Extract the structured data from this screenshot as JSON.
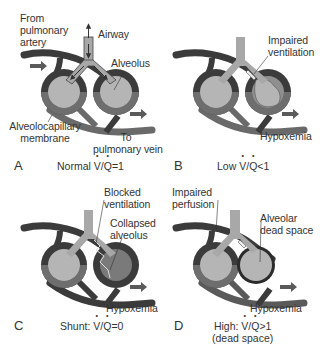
{
  "colors": {
    "vessel_dark": "#3b3b3b",
    "vessel_mid": "#6e6e6e",
    "airway_fill": "#a8a8a8",
    "alveolus_fill": "#b5b5b5",
    "collapsed_fill": "#8a8a8a",
    "arrow": "#5a5a5a",
    "background": "#ffffff"
  },
  "panels": [
    {
      "letter": "A",
      "caption_prefix": "Normal ",
      "caption_v": "V",
      "caption_slash": "/",
      "caption_q": "Q",
      "caption_suffix": "=1",
      "labels": {
        "from_artery": [
          "From",
          "pulmonary",
          "artery"
        ],
        "airway": "Airway",
        "alveolus": "Alveolus",
        "membrane": [
          "Alveolocapillary",
          "membrane"
        ],
        "to_vein": [
          "To",
          "pulmonary vein"
        ]
      }
    },
    {
      "letter": "B",
      "caption_prefix": "Low ",
      "caption_v": "V",
      "caption_slash": "/",
      "caption_q": "Q",
      "caption_suffix": "<1",
      "labels": {
        "impaired_ventilation": [
          "Impaired",
          "ventilation"
        ],
        "hypoxemia": "Hypoxemia"
      }
    },
    {
      "letter": "C",
      "caption_prefix": "Shunt: ",
      "caption_v": "V",
      "caption_slash": "/",
      "caption_q": "Q",
      "caption_suffix": "=0",
      "labels": {
        "blocked_ventilation": [
          "Blocked",
          "ventilation"
        ],
        "collapsed_alveolus": [
          "Collapsed",
          "alveolus"
        ],
        "hypoxemia": "Hypoxemia"
      }
    },
    {
      "letter": "D",
      "caption_prefix": "High: ",
      "caption_v": "V",
      "caption_slash": "/",
      "caption_q": "Q",
      "caption_suffix": ">1",
      "caption_line2": "(dead space)",
      "labels": {
        "impaired_perfusion": [
          "Impaired",
          "perfusion"
        ],
        "alveolar_dead_space": [
          "Alveolar",
          "dead space"
        ],
        "hypoxemia": "Hypoxemia"
      }
    }
  ]
}
